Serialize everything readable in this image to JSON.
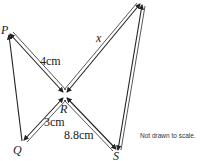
{
  "figure": {
    "points": {
      "P": {
        "label": "P",
        "x": 8,
        "y": 33
      },
      "Q": {
        "label": "Q",
        "x": 22,
        "y": 142
      },
      "R": {
        "label": "R",
        "x": 65,
        "y": 95
      },
      "S": {
        "label": "S",
        "x": 118,
        "y": 152
      },
      "T": {
        "label": "",
        "x": 142,
        "y": 3
      }
    },
    "measurements": {
      "PR": "4cm",
      "RT": "x",
      "ST": "13cm",
      "QR": "3cm",
      "RS": "8.8cm"
    },
    "note": "Not drawn to scale.",
    "colors": {
      "line": "#222222",
      "text": "#1a1a1a",
      "background": "#ffffff"
    }
  }
}
